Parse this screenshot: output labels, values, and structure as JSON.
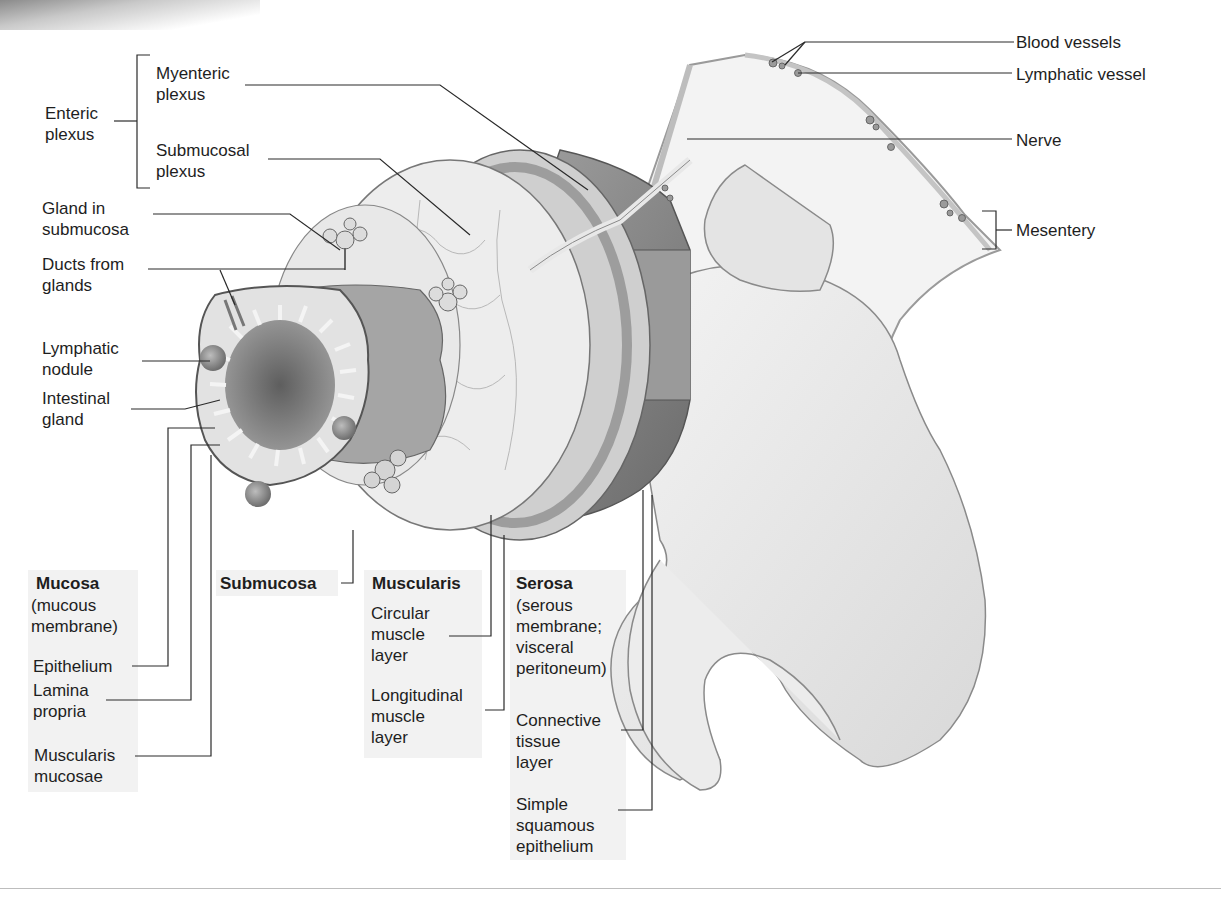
{
  "figure": {
    "top_labels": {
      "enteric_plexus": "Enteric\nplexus",
      "myenteric_plexus": "Myenteric\nplexus",
      "submucosal_plexus": "Submucosal\nplexus",
      "gland_in_submucosa": "Gland in\nsubmucosa",
      "ducts_from_glands": "Ducts from\nglands",
      "lymphatic_nodule": "Lymphatic\nnodule",
      "intestinal_gland": "Intestinal\ngland"
    },
    "right_labels": {
      "blood_vessels": "Blood vessels",
      "lymphatic_vessel": "Lymphatic vessel",
      "nerve": "Nerve",
      "mesentery": "Mesentery"
    },
    "mucosa": {
      "title": "Mucosa",
      "subtitle": "(mucous\nmembrane)",
      "items": [
        "Epithelium",
        "Lamina\npropria",
        "Muscularis\nmucosae"
      ]
    },
    "submucosa": {
      "title": "Submucosa"
    },
    "muscularis": {
      "title": "Muscularis",
      "items": [
        "Circular\nmuscle\nlayer",
        "Longitudinal\nmuscle\nlayer"
      ]
    },
    "serosa": {
      "title": "Serosa",
      "subtitle": "(serous\nmembrane;\nvisceral\nperitoneum)",
      "items": [
        "Connective\ntissue\nlayer",
        "Simple\nsquamous\nepithelium"
      ]
    },
    "colors": {
      "line": "#2a2a2a",
      "panel_bg": "#f2f2f2",
      "tissue_light": "#e6e6e6",
      "tissue_mid": "#b5b5b5",
      "tissue_dark": "#7a7a7a"
    }
  }
}
